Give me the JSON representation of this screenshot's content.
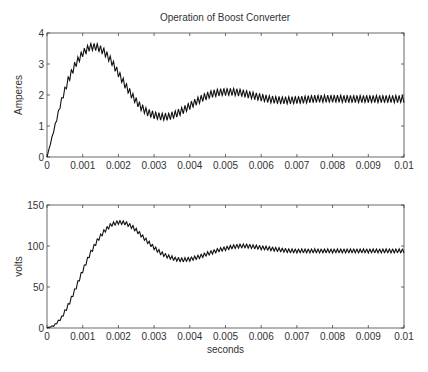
{
  "chart_data": [
    {
      "type": "line",
      "title": "Operation of Boost Converter",
      "xlabel": "",
      "ylabel": "Amperes",
      "xlim": [
        0,
        0.01
      ],
      "ylim": [
        0,
        4
      ],
      "x_ticks": [
        "0",
        "0.001",
        "0.002",
        "0.003",
        "0.004",
        "0.005",
        "0.006",
        "0.007",
        "0.008",
        "0.009",
        "0.01"
      ],
      "y_ticks": [
        "0",
        "1",
        "2",
        "3",
        "4"
      ],
      "grid": false,
      "series": [
        {
          "name": "inductor current",
          "x": [
            0,
            0.0002,
            0.0004,
            0.0006,
            0.0008,
            0.001,
            0.0012,
            0.0014,
            0.0016,
            0.0018,
            0.002,
            0.0022,
            0.0024,
            0.0026,
            0.0028,
            0.003,
            0.0032,
            0.0034,
            0.0036,
            0.0038,
            0.004,
            0.0042,
            0.0044,
            0.0046,
            0.0048,
            0.005,
            0.0052,
            0.0054,
            0.0056,
            0.0058,
            0.006,
            0.0062,
            0.0064,
            0.0066,
            0.0068,
            0.007,
            0.0072,
            0.0074,
            0.0076,
            0.0078,
            0.008,
            0.0082,
            0.0084,
            0.0086,
            0.0088,
            0.009,
            0.0092,
            0.0094,
            0.0096,
            0.0098,
            0.01
          ],
          "values": [
            0,
            0.9,
            1.8,
            2.5,
            3.0,
            3.35,
            3.55,
            3.55,
            3.4,
            3.1,
            2.7,
            2.3,
            1.95,
            1.65,
            1.45,
            1.35,
            1.3,
            1.3,
            1.38,
            1.5,
            1.65,
            1.8,
            1.93,
            2.03,
            2.08,
            2.1,
            2.1,
            2.08,
            2.03,
            1.97,
            1.92,
            1.87,
            1.84,
            1.83,
            1.83,
            1.84,
            1.85,
            1.87,
            1.88,
            1.88,
            1.88,
            1.88,
            1.87,
            1.87,
            1.87,
            1.87,
            1.87,
            1.87,
            1.87,
            1.87,
            1.87
          ],
          "ripple_amplitude": 0.12
        }
      ]
    },
    {
      "type": "line",
      "title": "",
      "xlabel": "seconds",
      "ylabel": "volts",
      "xlim": [
        0,
        0.01
      ],
      "ylim": [
        0,
        150
      ],
      "x_ticks": [
        "0",
        "0.001",
        "0.002",
        "0.003",
        "0.004",
        "0.005",
        "0.006",
        "0.007",
        "0.008",
        "0.009",
        "0.01"
      ],
      "y_ticks": [
        "0",
        "50",
        "100",
        "150"
      ],
      "grid": false,
      "series": [
        {
          "name": "output voltage",
          "x": [
            0,
            0.0002,
            0.0004,
            0.0006,
            0.0008,
            0.001,
            0.0012,
            0.0014,
            0.0016,
            0.0018,
            0.002,
            0.0022,
            0.0024,
            0.0026,
            0.0028,
            0.003,
            0.0032,
            0.0034,
            0.0036,
            0.0038,
            0.004,
            0.0042,
            0.0044,
            0.0046,
            0.0048,
            0.005,
            0.0052,
            0.0054,
            0.0056,
            0.0058,
            0.006,
            0.0062,
            0.0064,
            0.0066,
            0.0068,
            0.007,
            0.0072,
            0.0074,
            0.0076,
            0.0078,
            0.008,
            0.0082,
            0.0084,
            0.0086,
            0.0088,
            0.009,
            0.0092,
            0.0094,
            0.0096,
            0.0098,
            0.01
          ],
          "values": [
            0,
            3,
            12,
            28,
            48,
            70,
            90,
            106,
            118,
            126,
            129,
            128,
            123,
            115,
            106,
            98,
            91,
            87,
            84,
            83,
            84,
            86,
            89,
            92,
            95,
            97,
            99,
            100,
            100,
            99,
            98,
            97,
            96,
            95,
            94,
            94,
            94,
            94,
            94,
            94,
            94,
            94,
            94,
            94,
            94,
            94,
            94,
            94,
            94,
            94,
            94
          ],
          "ripple_amplitude": 2.5
        }
      ]
    }
  ]
}
